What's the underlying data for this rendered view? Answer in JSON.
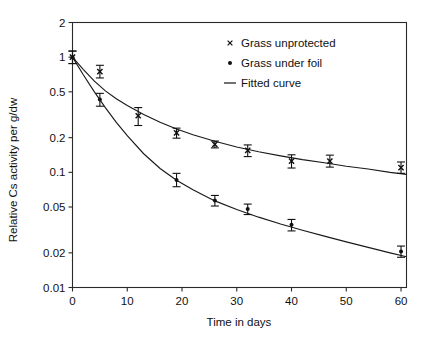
{
  "chart_data": {
    "type": "line",
    "title": "",
    "xlabel": "Time in days",
    "ylabel": "Relative Cs activity per g/dw",
    "xlim": [
      0,
      61
    ],
    "ylim": [
      0.01,
      2
    ],
    "yscale": "log",
    "grid": false,
    "legend_position": "top-right",
    "xticks": [
      0,
      10,
      20,
      30,
      40,
      50,
      60
    ],
    "xtick_labels": [
      "0",
      "10",
      "20",
      "30",
      "40",
      "50",
      "60"
    ],
    "yticks": [
      0.01,
      0.02,
      0.05,
      0.1,
      0.2,
      0.5,
      1,
      2
    ],
    "ytick_labels": [
      "0.01",
      "0.02",
      "0.05",
      "0.1",
      "0.2",
      "0.5",
      "1",
      "2"
    ],
    "series": [
      {
        "name": "Grass unprotected",
        "marker": "x",
        "x": [
          0,
          5,
          12,
          19,
          26,
          32,
          40,
          47,
          60
        ],
        "values": [
          1.0,
          0.75,
          0.31,
          0.22,
          0.175,
          0.155,
          0.125,
          0.125,
          0.11
        ],
        "yerr_low": [
          0.12,
          0.09,
          0.055,
          0.022,
          0.012,
          0.018,
          0.016,
          0.014,
          0.012
        ],
        "yerr_high": [
          0.13,
          0.1,
          0.055,
          0.022,
          0.012,
          0.018,
          0.017,
          0.016,
          0.013
        ]
      },
      {
        "name": "Grass under foil",
        "marker": "dot",
        "x": [
          0,
          5,
          19,
          26,
          32,
          40,
          60
        ],
        "values": [
          1.0,
          0.43,
          0.086,
          0.057,
          0.048,
          0.035,
          0.0205
        ],
        "yerr_low": [
          0.12,
          0.055,
          0.011,
          0.006,
          0.005,
          0.004,
          0.0022
        ],
        "yerr_high": [
          0.13,
          0.055,
          0.012,
          0.006,
          0.005,
          0.004,
          0.0024
        ]
      }
    ],
    "fitted_curves": [
      {
        "name": "Fitted curve (unprotected)",
        "model": "biexponential",
        "points_x": [
          0,
          2,
          4,
          6,
          8,
          10,
          13,
          16,
          19,
          22,
          26,
          30,
          34,
          38,
          42,
          46,
          50,
          54,
          58,
          61
        ],
        "points_y": [
          1.0,
          0.78,
          0.62,
          0.51,
          0.435,
          0.38,
          0.318,
          0.272,
          0.238,
          0.212,
          0.186,
          0.166,
          0.151,
          0.139,
          0.129,
          0.121,
          0.113,
          0.107,
          0.1,
          0.096
        ]
      },
      {
        "name": "Fitted curve (under foil)",
        "model": "biexponential",
        "points_x": [
          0,
          2,
          4,
          6,
          8,
          10,
          13,
          16,
          19,
          22,
          26,
          30,
          34,
          38,
          42,
          46,
          50,
          54,
          58,
          61
        ],
        "points_y": [
          1.0,
          0.7,
          0.5,
          0.365,
          0.272,
          0.208,
          0.145,
          0.108,
          0.0855,
          0.0705,
          0.0565,
          0.0475,
          0.0408,
          0.0356,
          0.0314,
          0.0279,
          0.0249,
          0.0223,
          0.02,
          0.0185
        ]
      }
    ],
    "legend": [
      {
        "label": "Grass unprotected",
        "marker": "x"
      },
      {
        "label": "Grass under foil",
        "marker": "dot"
      },
      {
        "label": "Fitted curve",
        "marker": "line"
      }
    ]
  }
}
